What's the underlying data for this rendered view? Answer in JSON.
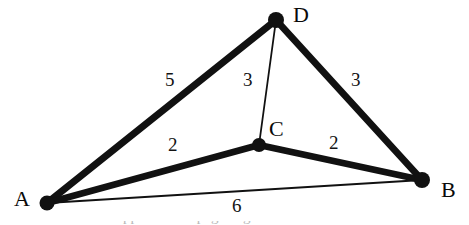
{
  "figure": {
    "kind": "weighted-graph-diagram",
    "background_color": "#ffffff",
    "ink_color": "#111111",
    "width": 469,
    "height": 225
  },
  "vertices": [
    {
      "id": "A",
      "label": "A",
      "x": 47,
      "y": 203,
      "label_x": 14,
      "label_y": 188,
      "dot_r": 7.5
    },
    {
      "id": "B",
      "label": "B",
      "x": 422,
      "y": 180,
      "label_x": 441,
      "label_y": 179,
      "dot_r": 8.0
    },
    {
      "id": "C",
      "label": "C",
      "x": 259,
      "y": 145,
      "label_x": 269,
      "label_y": 118,
      "dot_r": 7.0
    },
    {
      "id": "D",
      "label": "D",
      "x": 276,
      "y": 20,
      "label_x": 293,
      "label_y": 4,
      "dot_r": 8.0
    }
  ],
  "edges": [
    {
      "id": "AD",
      "from": "A",
      "to": "D",
      "weight": "5",
      "style": "thick",
      "stroke_width": 7,
      "label_x": 165,
      "label_y": 70
    },
    {
      "id": "DB",
      "from": "D",
      "to": "B",
      "weight": "3",
      "style": "thick",
      "stroke_width": 7,
      "label_x": 351,
      "label_y": 70
    },
    {
      "id": "AC",
      "from": "A",
      "to": "C",
      "weight": "2",
      "style": "thick",
      "stroke_width": 6.5,
      "label_x": 168,
      "label_y": 135
    },
    {
      "id": "CB",
      "from": "C",
      "to": "B",
      "weight": "2",
      "style": "thick",
      "stroke_width": 6.5,
      "label_x": 329,
      "label_y": 133
    },
    {
      "id": "DC",
      "from": "D",
      "to": "C",
      "weight": "3",
      "style": "thin",
      "stroke_width": 1.8,
      "label_x": 243,
      "label_y": 70
    },
    {
      "id": "AB",
      "from": "A",
      "to": "B",
      "weight": "6",
      "style": "thin",
      "stroke_width": 1.8,
      "label_x": 232,
      "label_y": 196
    }
  ],
  "cutoff": {
    "text": "clipped text at page edge"
  },
  "chart_data": {
    "type": "diagram",
    "title": "",
    "nodes": [
      "A",
      "B",
      "C",
      "D"
    ],
    "weighted_edges": [
      {
        "endpoints": [
          "A",
          "D"
        ],
        "weight": 5
      },
      {
        "endpoints": [
          "D",
          "B"
        ],
        "weight": 3
      },
      {
        "endpoints": [
          "D",
          "C"
        ],
        "weight": 3
      },
      {
        "endpoints": [
          "A",
          "C"
        ],
        "weight": 2
      },
      {
        "endpoints": [
          "C",
          "B"
        ],
        "weight": 2
      },
      {
        "endpoints": [
          "A",
          "B"
        ],
        "weight": 6
      }
    ]
  }
}
